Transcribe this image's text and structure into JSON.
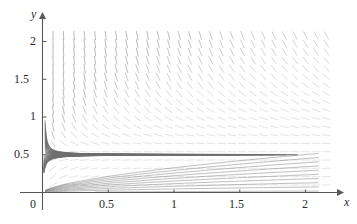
{
  "chart_data": {
    "type": "line",
    "title": "",
    "subtitle": "",
    "xlabel": "x",
    "ylabel": "y",
    "xlim": [
      0,
      2.2
    ],
    "ylim": [
      0,
      2.15
    ],
    "grid": false,
    "legend": null,
    "annotations": [],
    "plot_kind": "direction-field-with-solution-curves",
    "axes": {
      "x_ticks": [
        0,
        0.5,
        1,
        1.5,
        2
      ],
      "x_tick_labels": [
        "0",
        "0.5",
        "1",
        "1.5",
        "2"
      ],
      "y_ticks": [
        0.5,
        1,
        1.5,
        2
      ],
      "y_tick_labels": [
        "0.5",
        "1",
        "1.5",
        "2"
      ],
      "x_axis_arrow": true,
      "y_axis_arrow": true,
      "origin_label": "0"
    },
    "slope_field": {
      "x_start": 0.08,
      "x_end": 2.16,
      "x_step": 0.08,
      "y_start": 0.1,
      "y_end": 2.08,
      "y_step": 0.11,
      "dash_length_px": 9,
      "slope_formula": "dy/dx = (y - 2*y*y) / x  (normalized for drawing)",
      "color": "#8f8f8f"
    },
    "solution_curves": {
      "count": 22,
      "color": "#6e6e6e",
      "turning_y": 0.5,
      "x_offsets": [
        0.0,
        0.09,
        0.18,
        0.27,
        0.36,
        0.45,
        0.54,
        0.63,
        0.72,
        0.81,
        0.9,
        0.99,
        1.08,
        1.17,
        1.26,
        1.35,
        1.44,
        1.53,
        1.62,
        1.71,
        1.8,
        1.89
      ]
    },
    "series": [
      {
        "name": "solution-curve-family",
        "values": []
      }
    ],
    "colors": {
      "axis": "#585858",
      "field": "#8f8f8f",
      "curve": "#6e6e6e",
      "text": "#2b2b2b",
      "background": "#ffffff"
    }
  },
  "labels": {
    "x_axis": "x",
    "y_axis": "y",
    "x_ticks": [
      "0",
      "0.5",
      "1",
      "1.5",
      "2"
    ],
    "y_ticks": [
      "0.5",
      "1",
      "1.5",
      "2"
    ]
  }
}
